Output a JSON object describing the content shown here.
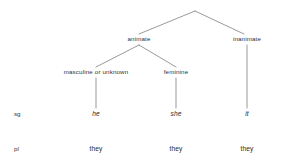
{
  "diagram": {
    "line_color": "#6e6e6e",
    "text_color": "#2b2b2b",
    "nodes": {
      "root": "",
      "animate": "animate",
      "inanimate": "inanimate",
      "masculine_or_unknown": "masculine or unknown",
      "feminine": "feminine"
    },
    "row_labels": {
      "singular": "sg",
      "plural": "pl"
    },
    "singular_forms": {
      "masculine": "he",
      "feminine": "she",
      "inanimate": "it"
    },
    "plural_forms": {
      "masculine": "they",
      "feminine": "they",
      "inanimate": "they"
    }
  }
}
